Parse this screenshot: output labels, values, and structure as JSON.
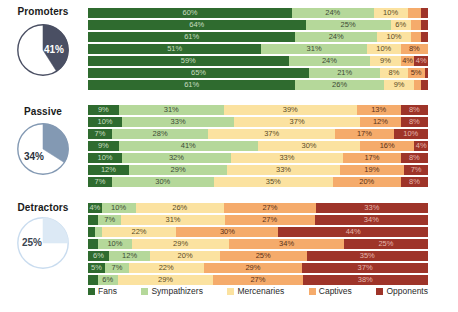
{
  "chart_data": {
    "type": "bar",
    "title": "",
    "subtitle": "",
    "orientation": "horizontal",
    "stacked": true,
    "normalized_percent": true,
    "xlabel": "",
    "ylabel": "",
    "xlim": [
      0,
      100
    ],
    "grid": false,
    "legend_position": "bottom",
    "categories": [
      "Fans",
      "Sympathizers",
      "Mercenaries",
      "Captives",
      "Opponents"
    ],
    "category_colors": [
      "#2f6b2f",
      "#b5d89a",
      "#fbe2a0",
      "#f5ab6b",
      "#9e3429"
    ],
    "groups": [
      {
        "name": "Promoters",
        "pie_value": 41,
        "pie_label": "41%",
        "pie_color": "#4a4f63",
        "pie_rest_color": "#ffffff",
        "rows": [
          {
            "values": [
              60,
              24,
              10,
              4,
              2
            ],
            "labels": [
              "60%",
              "24%",
              "10%",
              "",
              ""
            ]
          },
          {
            "values": [
              64,
              25,
              6,
              3,
              2
            ],
            "labels": [
              "64%",
              "25%",
              "6%",
              "",
              ""
            ]
          },
          {
            "values": [
              61,
              24,
              10,
              3,
              2
            ],
            "labels": [
              "61%",
              "24%",
              "10%",
              "",
              ""
            ]
          },
          {
            "values": [
              51,
              31,
              10,
              8,
              0
            ],
            "labels": [
              "51%",
              "31%",
              "10%",
              "8%",
              ""
            ]
          },
          {
            "values": [
              59,
              24,
              9,
              4,
              4
            ],
            "labels": [
              "59%",
              "24%",
              "9%",
              "4%",
              "4%"
            ]
          },
          {
            "values": [
              65,
              21,
              8,
              5,
              1
            ],
            "labels": [
              "65%",
              "21%",
              "8%",
              "5%",
              ""
            ]
          },
          {
            "values": [
              61,
              26,
              9,
              2,
              2
            ],
            "labels": [
              "61%",
              "26%",
              "9%",
              "",
              ""
            ]
          }
        ]
      },
      {
        "name": "Passive",
        "pie_value": 34,
        "pie_label": "34%",
        "pie_color": "#8399b3",
        "pie_rest_color": "#ffffff",
        "rows": [
          {
            "values": [
              9,
              31,
              39,
              13,
              8
            ],
            "labels": [
              "9%",
              "31%",
              "39%",
              "13%",
              "8%"
            ]
          },
          {
            "values": [
              10,
              33,
              37,
              12,
              8
            ],
            "labels": [
              "10%",
              "33%",
              "37%",
              "12%",
              "8%"
            ]
          },
          {
            "values": [
              7,
              28,
              37,
              17,
              10
            ],
            "labels": [
              "7%",
              "28%",
              "37%",
              "17%",
              "10%"
            ]
          },
          {
            "values": [
              9,
              41,
              30,
              16,
              4
            ],
            "labels": [
              "9%",
              "41%",
              "30%",
              "16%",
              "4%"
            ]
          },
          {
            "values": [
              10,
              32,
              33,
              17,
              8
            ],
            "labels": [
              "10%",
              "32%",
              "33%",
              "17%",
              "8%"
            ]
          },
          {
            "values": [
              12,
              29,
              33,
              19,
              7
            ],
            "labels": [
              "12%",
              "29%",
              "33%",
              "19%",
              "7%"
            ]
          },
          {
            "values": [
              7,
              30,
              35,
              20,
              8
            ],
            "labels": [
              "7%",
              "30%",
              "35%",
              "20%",
              "8%"
            ]
          }
        ]
      },
      {
        "name": "Detractors",
        "pie_value": 25,
        "pie_label": "25%",
        "pie_color": "#dce9f5",
        "pie_rest_color": "#ffffff",
        "rows": [
          {
            "values": [
              4,
              10,
              26,
              27,
              33
            ],
            "labels": [
              "4%",
              "10%",
              "26%",
              "27%",
              "33%"
            ]
          },
          {
            "values": [
              3,
              7,
              31,
              27,
              34
            ],
            "labels": [
              "",
              "7%",
              "31%",
              "27%",
              "34%"
            ]
          },
          {
            "values": [
              2,
              2,
              22,
              30,
              44
            ],
            "labels": [
              "",
              "",
              "22%",
              "30%",
              "44%"
            ]
          },
          {
            "values": [
              3,
              10,
              29,
              34,
              25
            ],
            "labels": [
              "",
              "10%",
              "29%",
              "34%",
              "25%"
            ]
          },
          {
            "values": [
              6,
              12,
              20,
              25,
              35
            ],
            "labels": [
              "6%",
              "12%",
              "20%",
              "25%",
              "35%"
            ]
          },
          {
            "values": [
              5,
              7,
              22,
              29,
              37
            ],
            "labels": [
              "5%",
              "7%",
              "22%",
              "29%",
              "37%"
            ]
          },
          {
            "values": [
              3,
              6,
              29,
              27,
              38
            ],
            "labels": [
              "",
              "6%",
              "29%",
              "27%",
              "38%"
            ]
          }
        ]
      }
    ]
  },
  "groups": {
    "promoters": {
      "name": "Promoters",
      "pie_label": "41%"
    },
    "passive": {
      "name": "Passive",
      "pie_label": "34%"
    },
    "detractors": {
      "name": "Detractors",
      "pie_label": "25%"
    }
  },
  "legend": {
    "items": [
      {
        "label": "Fans",
        "color": "#2f6b2f"
      },
      {
        "label": "Sympathizers",
        "color": "#b5d89a"
      },
      {
        "label": "Mercenaries",
        "color": "#fbe2a0"
      },
      {
        "label": "Captives",
        "color": "#f5ab6b"
      },
      {
        "label": "Opponents",
        "color": "#9e3429"
      }
    ]
  }
}
